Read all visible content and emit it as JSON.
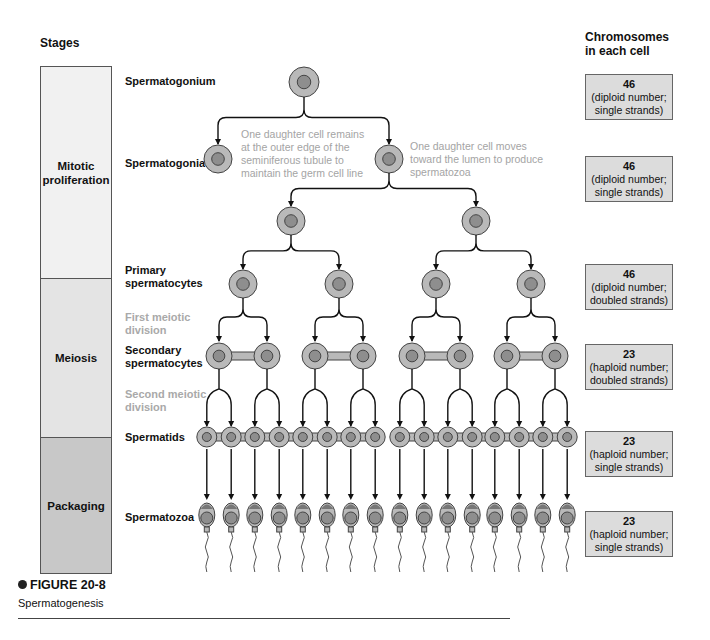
{
  "headers": {
    "stages": "Stages",
    "chromosomes_line1": "Chromosomes",
    "chromosomes_line2": "in each cell"
  },
  "stages": [
    {
      "line1": "Mitotic",
      "line2": "proliferation",
      "color": "#f1f1f1"
    },
    {
      "line1": "Meiosis",
      "line2": "",
      "color": "#e4e4e4"
    },
    {
      "line1": "Packaging",
      "line2": "",
      "color": "#c8c8c8"
    }
  ],
  "rows": {
    "spermatogonium": "Spermatogonium",
    "spermatogonia": "Spermatogonia",
    "primary_1": "Primary",
    "primary_2": "spermatocytes",
    "first_meiotic_1": "First meiotic",
    "first_meiotic_2": "division",
    "secondary_1": "Secondary",
    "secondary_2": "spermatocytes",
    "second_meiotic_1": "Second meiotic",
    "second_meiotic_2": "division",
    "spermatids": "Spermatids",
    "spermatozoa": "Spermatozoa"
  },
  "notes": {
    "left": [
      "One daughter cell remains",
      "at the outer edge of the",
      "seminiferous tubule to",
      "maintain the germ cell line"
    ],
    "right": [
      "One daughter cell moves",
      "toward the lumen to produce",
      "spermatozoa"
    ]
  },
  "chromosome_boxes": [
    {
      "count": "46",
      "line1": "(diploid number;",
      "line2": "single strands)"
    },
    {
      "count": "46",
      "line1": "(diploid number;",
      "line2": "single strands)"
    },
    {
      "count": "46",
      "line1": "(diploid number;",
      "line2": "doubled strands)"
    },
    {
      "count": "23",
      "line1": "(haploid number;",
      "line2": "doubled strands)"
    },
    {
      "count": "23",
      "line1": "(haploid number;",
      "line2": "single strands)"
    },
    {
      "count": "23",
      "line1": "(haploid number;",
      "line2": "single strands)"
    }
  ],
  "figure": {
    "title": "FIGURE 20-8",
    "caption": "Spermatogenesis"
  },
  "colors": {
    "cell_outer": "#b9b9b9",
    "cell_nucleus": "#8e8e8e",
    "outline": "#444444",
    "muted_text": "#a4a4a4",
    "chromo_box": "#dcdcdc"
  }
}
